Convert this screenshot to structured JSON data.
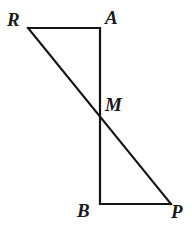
{
  "figure": {
    "type": "geometry-diagram",
    "canvas": {
      "width": 192,
      "height": 233,
      "background": "#ffffff"
    },
    "style": {
      "stroke_color": "#141414",
      "stroke_width": 2.2,
      "label_color": "#1a1a1a",
      "label_font_size": 19,
      "label_style": "italic-serif-bold"
    },
    "points": [
      {
        "id": "R",
        "label": "R",
        "x": 28,
        "y": 28,
        "label_x": 7,
        "label_y": 10
      },
      {
        "id": "A",
        "label": "A",
        "x": 100,
        "y": 28,
        "label_x": 105,
        "label_y": 8
      },
      {
        "id": "M",
        "label": "M",
        "x": 100,
        "y": 113,
        "label_x": 105,
        "label_y": 95
      },
      {
        "id": "B",
        "label": "B",
        "x": 100,
        "y": 204,
        "label_x": 77,
        "label_y": 201
      },
      {
        "id": "P",
        "label": "P",
        "x": 171,
        "y": 204,
        "label_x": 171,
        "label_y": 202
      }
    ],
    "segments": [
      {
        "id": "RA",
        "from": "R",
        "to": "A",
        "x1": 28,
        "y1": 28,
        "x2": 100,
        "y2": 28
      },
      {
        "id": "AB",
        "from": "A",
        "to": "B",
        "x1": 100,
        "y1": 28,
        "x2": 100,
        "y2": 204
      },
      {
        "id": "BP",
        "from": "B",
        "to": "P",
        "x1": 100,
        "y1": 204,
        "x2": 171,
        "y2": 204
      },
      {
        "id": "RP",
        "from": "R",
        "to": "P",
        "x1": 28,
        "y1": 28,
        "x2": 171,
        "y2": 204
      }
    ],
    "intersection": {
      "id": "M",
      "of": [
        "AB",
        "RP"
      ],
      "x": 100,
      "y": 113
    }
  }
}
